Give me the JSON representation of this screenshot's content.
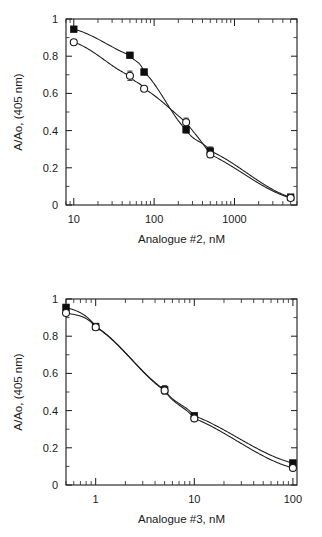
{
  "figure": {
    "panels": [
      "top",
      "bottom"
    ]
  },
  "chart_data": [
    {
      "type": "scatter",
      "panel": "top",
      "title": "",
      "xlabel": "Analogue #2, nM",
      "ylabel": "A/Ao, (405 nm)",
      "xscale": "log",
      "yscale": "linear",
      "xlim": [
        8,
        6000
      ],
      "ylim": [
        0,
        1
      ],
      "grid": false,
      "legend_position": "none",
      "xticks": [
        10,
        100,
        1000
      ],
      "xticklabels": [
        "10",
        "100",
        "1000"
      ],
      "yticks": [
        0,
        0.2,
        0.4,
        0.6,
        0.8,
        1
      ],
      "yticklabels": [
        "0",
        "0.2",
        "0.4",
        "0.6",
        "0.8",
        "1"
      ],
      "series": [
        {
          "name": "filled-square-series",
          "marker": "filled-square",
          "x": [
            10,
            50,
            75,
            250,
            500,
            5000
          ],
          "values": [
            0.945,
            0.805,
            0.715,
            0.405,
            0.29,
            0.042
          ],
          "errors": [
            0.012,
            0.012,
            0.012,
            0.018,
            0.022,
            0.01
          ]
        },
        {
          "name": "open-circle-series",
          "marker": "open-circle",
          "x": [
            10,
            50,
            75,
            250,
            500,
            5000
          ],
          "values": [
            0.875,
            0.695,
            0.625,
            0.445,
            0.272,
            0.038
          ],
          "errors": [
            0.012,
            0.025,
            0.012,
            0.022,
            0.015,
            0.01
          ]
        }
      ]
    },
    {
      "type": "scatter",
      "panel": "bottom",
      "title": "",
      "xlabel": "Analogue #3, nM",
      "ylabel": "A/Ao, (405 nm)",
      "xscale": "log",
      "yscale": "linear",
      "xlim": [
        0.5,
        110
      ],
      "ylim": [
        0,
        1
      ],
      "grid": false,
      "legend_position": "none",
      "xticks": [
        1,
        10,
        100
      ],
      "xticklabels": [
        "1",
        "10",
        "100"
      ],
      "yticks": [
        0,
        0.2,
        0.4,
        0.6,
        0.8,
        1
      ],
      "yticklabels": [
        "0",
        "0.2",
        "0.4",
        "0.6",
        "0.8",
        "1"
      ],
      "series": [
        {
          "name": "filled-square-series",
          "marker": "filled-square",
          "x": [
            0.5,
            1,
            5,
            10,
            100
          ],
          "values": [
            0.955,
            0.852,
            0.512,
            0.372,
            0.118
          ],
          "errors": [
            0.012,
            0.012,
            0.022,
            0.014,
            0.012
          ]
        },
        {
          "name": "open-circle-series",
          "marker": "open-circle",
          "x": [
            0.5,
            1,
            5,
            10,
            100
          ],
          "values": [
            0.925,
            0.848,
            0.508,
            0.358,
            0.092
          ],
          "errors": [
            0.012,
            0.012,
            0.018,
            0.014,
            0.01
          ]
        }
      ]
    }
  ]
}
